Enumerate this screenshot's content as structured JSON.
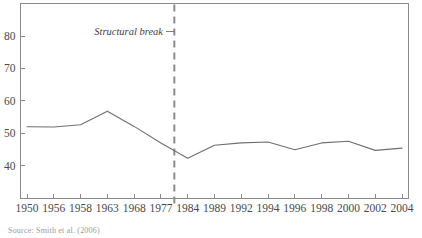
{
  "chart_data": {
    "type": "line",
    "title": "",
    "subtitle": "",
    "xlabel": "",
    "ylabel": "",
    "grid": false,
    "legend": "none",
    "categories": [
      "1950",
      "1956",
      "1958",
      "1963",
      "1968",
      "1977",
      "1984",
      "1989",
      "1992",
      "1994",
      "1996",
      "1998",
      "2000",
      "2002",
      "2004"
    ],
    "x_tick_labels": [
      "1950",
      "1956",
      "1958",
      "1963",
      "1968",
      "1977",
      "1984",
      "1989",
      "1992",
      "1994",
      "1996",
      "1998",
      "2000",
      "2002",
      "2004"
    ],
    "y_tick_labels": [
      "80",
      "70",
      "60",
      "50",
      "40"
    ],
    "y_ticks": [
      80,
      70,
      60,
      50,
      40
    ],
    "ylim": [
      33,
      87
    ],
    "series": [
      {
        "name": "value",
        "values": [
          52.0,
          51.9,
          52.6,
          56.8,
          52.1,
          47.0,
          42.3,
          46.3,
          47.0,
          47.3,
          44.9,
          47.0,
          47.5,
          44.7,
          45.4
        ]
      }
    ],
    "annotations": [
      {
        "label": "Structural break",
        "type": "vertical-dashed-line",
        "x_position_between": [
          "1977",
          "1984"
        ]
      }
    ],
    "colors": {
      "series_line": "#6f6f6f",
      "axis": "#8a8a8a",
      "break_line": "#8c8c8c",
      "text": "#4a4a4a"
    }
  },
  "source_note": "Source: Smith et al. (2006)"
}
